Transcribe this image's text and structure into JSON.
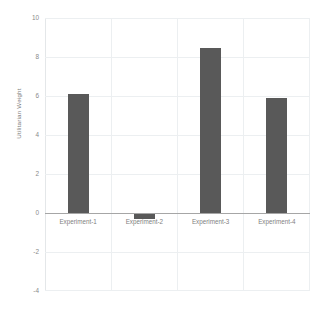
{
  "chart_data": {
    "type": "bar",
    "title": "",
    "xlabel": "",
    "ylabel": "Utilitarian Weight",
    "categories": [
      "Experiment-1",
      "Experiment-2",
      "Experiment-3",
      "Experiment-4"
    ],
    "values": [
      6.1,
      -0.3,
      8.45,
      5.9
    ],
    "series": [
      {
        "name": "Utilitarian Weight",
        "values": [
          6.1,
          -0.3,
          8.45,
          5.9
        ]
      }
    ],
    "ylim": [
      -4,
      10
    ],
    "yticks": [
      10,
      8,
      6,
      4,
      2,
      0,
      -2,
      -4
    ],
    "ytick_labels": [
      "10",
      "8",
      "6",
      "4",
      "2",
      "0",
      "-2",
      "-4"
    ],
    "grid": true,
    "grid_axis": "both",
    "legend": false,
    "legend_position": "none",
    "zero_line": true,
    "bar_color": "#595959",
    "gridline_color": "#eceff1",
    "zero_line_color": "#a6a6a6",
    "tick_label_color": "#8a8a8a",
    "background_color": "#ffffff"
  }
}
